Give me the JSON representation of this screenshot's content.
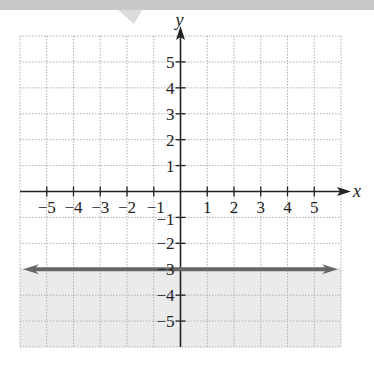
{
  "chart_data": {
    "type": "line",
    "title": "",
    "xlabel": "x",
    "ylabel": "y",
    "xlim": [
      -6,
      6
    ],
    "ylim": [
      -6,
      6
    ],
    "grid": true,
    "x_ticks": [
      -5,
      -4,
      -3,
      -2,
      -1,
      1,
      2,
      3,
      4,
      5
    ],
    "y_ticks": [
      -5,
      -4,
      -3,
      -2,
      -1,
      1,
      2,
      3,
      4,
      5
    ],
    "x_tick_labels": [
      "−5",
      "−4",
      "−3",
      "−2",
      "−1",
      "1",
      "2",
      "3",
      "4",
      "5"
    ],
    "y_tick_labels": [
      "−5",
      "−4",
      "−3",
      "−2",
      "−1",
      "1",
      "2",
      "3",
      "4",
      "5"
    ],
    "series": [
      {
        "name": "y = -3",
        "kind": "horizontal-line",
        "equation": "y = -3",
        "y": -3,
        "x": [
          -6,
          6
        ],
        "line_style": "solid",
        "arrows": "both",
        "color": "#666666"
      }
    ],
    "shaded_region": {
      "description": "y < -3 (below the line)",
      "inequality": "y <= -3",
      "color": "#ebebeb"
    }
  },
  "colors": {
    "banner": "#c9c9c9",
    "grid": "#b0b0b0",
    "axis": "#222222",
    "line": "#666666",
    "shade": "#ebebeb"
  }
}
